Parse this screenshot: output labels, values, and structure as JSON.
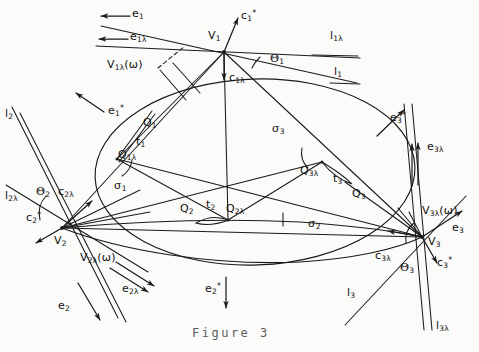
{
  "figure": {
    "caption": "Figure 3",
    "width": 479,
    "height": 352,
    "ink_color": "#1a1a1a",
    "paper_color": "#fbfbf9"
  },
  "labels": {
    "e1": "e",
    "e1_sub": "1",
    "e1l": "e",
    "e1l_sub": "1λ",
    "e1star": "e",
    "e1star_sub": "1",
    "e1star_sup": "*",
    "V1": "V",
    "V1_sub": "1",
    "c1star": "c",
    "c1star_sub": "1",
    "c1star_sup": "*",
    "c1l": "c",
    "c1l_sub": "1λ",
    "l1l": "l",
    "l1l_sub": "1λ",
    "l1": "l",
    "l1_sub": "1",
    "theta1": "Θ",
    "theta1_sub": "1",
    "V1lw": "V",
    "V1lw_sub": "1λ",
    "V1lw_arg": "(ω)",
    "l2": "l",
    "l2_sub": "2",
    "l2l": "l",
    "l2l_sub": "2λ",
    "theta2": "Θ",
    "theta2_sub": "2",
    "c2l": "c",
    "c2l_sub": "2λ",
    "c2star": "c",
    "c2star_sub": "2",
    "c2star_sup": "*",
    "V2": "V",
    "V2_sub": "2",
    "V2lw": "V",
    "V2lw_sub": "2λ",
    "V2lw_arg": "(ω)",
    "e2l": "e",
    "e2l_sub": "2λ",
    "e2": "e",
    "e2_sub": "2",
    "e2star": "e",
    "e2star_sub": "2",
    "e2star_sup": "*",
    "Q1": "Q",
    "Q1_sub": "1",
    "t1": "t",
    "t1_sub": "1",
    "Q1l": "Q",
    "Q1l_sub": "1λ",
    "sigma1": "σ",
    "sigma1_sub": "1",
    "Q2": "Q",
    "Q2_sub": "2",
    "t2": "t",
    "t2_sub": "2",
    "Q2l": "Q",
    "Q2l_sub": "2λ",
    "sigma2": "σ",
    "sigma2_sub": "2",
    "sigma3": "σ",
    "sigma3_sub": "3",
    "Q3l": "Q",
    "Q3l_sub": "3λ",
    "t3": "t",
    "t3_sub": "3",
    "Q3": "Q",
    "Q3_sub": "3",
    "e3star": "e",
    "e3star_sub": "3",
    "e3star_sup": "*",
    "e3l": "e",
    "e3l_sub": "3λ",
    "e3": "e",
    "e3_sub": "3",
    "V3lw": "V",
    "V3lw_sub": "3λ",
    "V3lw_arg": "(ω)",
    "V3": "V",
    "V3_sub": "3",
    "c3l": "c",
    "c3l_sub": "3λ",
    "theta3": "Θ",
    "theta3_sub": "3",
    "c3star": "c",
    "c3star_sub": "3",
    "c3star_sup": "*",
    "l3": "l",
    "l3_sub": "3",
    "l3l": "l",
    "l3l_sub": "3λ"
  },
  "geometry": {
    "vertices": {
      "V1": [
        224,
        52
      ],
      "V2": [
        62,
        228
      ],
      "V3": [
        422,
        237
      ]
    },
    "tangent_points": {
      "Q1l": [
        117,
        159
      ],
      "Q2l": [
        228,
        220
      ],
      "Q3l": [
        322,
        162
      ],
      "Q1": [
        141,
        115
      ],
      "Q2": [
        205,
        218
      ],
      "Q3": [
        345,
        182
      ]
    },
    "conic": {
      "type": "ellipse",
      "center": [
        255,
        172
      ],
      "rx": 160,
      "ry": 93,
      "rotation_deg": -2
    }
  }
}
